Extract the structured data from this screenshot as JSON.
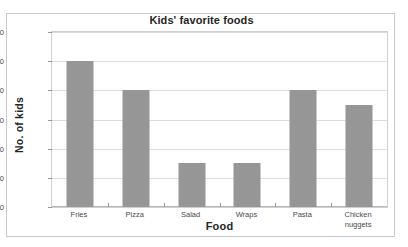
{
  "chart_data": {
    "type": "bar",
    "title": "Kids' favorite foods",
    "xlabel": "Food",
    "ylabel": "No. of kids",
    "categories": [
      "Fries",
      "Pizza",
      "Salad",
      "Wraps",
      "Pasta",
      "Chicken\nnuggets"
    ],
    "values": [
      50,
      40,
      15,
      15,
      40,
      35
    ],
    "ylim": [
      0,
      60
    ],
    "yticks": [
      0,
      10,
      20,
      30,
      40,
      50,
      60
    ],
    "ytick_labels": [
      "0",
      "10",
      "20",
      "30",
      "40",
      "50",
      "60"
    ],
    "grid": true,
    "legend": false,
    "bar_color": "#969696",
    "gridline_color": "#dcdcdc",
    "axis_color": "#b9b9b9",
    "text_color": "#262626",
    "tick_text_color": "#4a4a4a",
    "background": "#ffffff"
  }
}
